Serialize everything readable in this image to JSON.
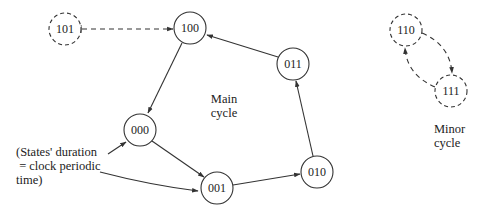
{
  "diagram": {
    "type": "state-transition-diagram",
    "nodes": [
      {
        "id": "101",
        "label": "101",
        "style": "dashed",
        "cx": 65,
        "cy": 29,
        "r": 16
      },
      {
        "id": "100",
        "label": "100",
        "style": "solid",
        "cx": 190,
        "cy": 28,
        "r": 16
      },
      {
        "id": "000",
        "label": "000",
        "style": "solid",
        "cx": 140,
        "cy": 130,
        "r": 16
      },
      {
        "id": "001",
        "label": "001",
        "style": "solid",
        "cx": 217,
        "cy": 188,
        "r": 16
      },
      {
        "id": "010",
        "label": "010",
        "style": "solid",
        "cx": 317,
        "cy": 172,
        "r": 16
      },
      {
        "id": "011",
        "label": "011",
        "style": "solid",
        "cx": 293,
        "cy": 64,
        "r": 16
      },
      {
        "id": "110",
        "label": "110",
        "style": "dashed",
        "cx": 406,
        "cy": 30,
        "r": 16
      },
      {
        "id": "111",
        "label": "111",
        "style": "dashed",
        "cx": 451,
        "cy": 91,
        "r": 16
      }
    ],
    "edges": [
      {
        "from": "101",
        "to": "100",
        "style": "dashed"
      },
      {
        "from": "100",
        "to": "000",
        "style": "solid"
      },
      {
        "from": "000",
        "to": "001",
        "style": "solid"
      },
      {
        "from": "001",
        "to": "010",
        "style": "solid"
      },
      {
        "from": "010",
        "to": "011",
        "style": "solid"
      },
      {
        "from": "011",
        "to": "100",
        "style": "solid"
      },
      {
        "from": "110",
        "to": "111",
        "style": "dashed"
      },
      {
        "from": "111",
        "to": "110",
        "style": "dashed"
      }
    ],
    "labels": {
      "main_cycle": "Main\ncycle",
      "minor_cycle": "Minor\ncycle",
      "annotation": "(States' duration\n = clock periodic\ntime)"
    },
    "annotation_pointers": [
      "000",
      "001"
    ]
  }
}
